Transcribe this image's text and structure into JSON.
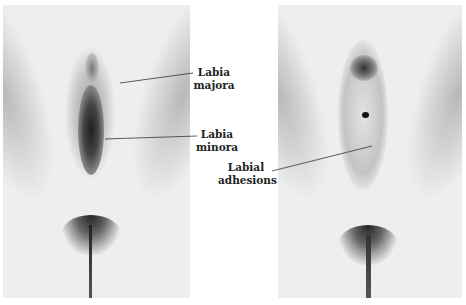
{
  "figure": {
    "panels": [
      {
        "id": "normal",
        "description": "Normal external genital anatomy"
      },
      {
        "id": "adhesions",
        "description": "Labial adhesions"
      }
    ],
    "labels": {
      "labia_majora": [
        "Labia",
        "majora"
      ],
      "labia_minora": [
        "Labia",
        "minora"
      ],
      "labial_adhesions": [
        "Labial",
        "adhesions"
      ]
    },
    "colors": {
      "background": "#ffffff",
      "skin": "#eeeeee",
      "shadow": "#555555",
      "text": "#222222",
      "leader_line": "#333333"
    }
  }
}
